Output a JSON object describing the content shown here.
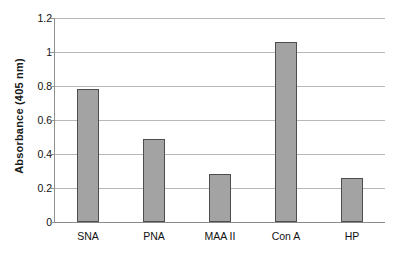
{
  "chart_data": {
    "type": "bar",
    "title": "",
    "subtitle": "",
    "xlabel": "",
    "ylabel": "Absorbance (405 nm)",
    "categories": [
      "SNA",
      "PNA",
      "MAA II",
      "Con A",
      "HP"
    ],
    "values": [
      0.78,
      0.49,
      0.285,
      1.06,
      0.26
    ],
    "series": [
      {
        "name": "Absorbance",
        "values": [
          0.78,
          0.49,
          0.285,
          1.06,
          0.26
        ]
      }
    ],
    "ylim": [
      0,
      1.2
    ],
    "ytick_values": [
      0,
      0.2,
      0.4,
      0.6,
      0.8,
      1,
      1.2
    ],
    "ytick_labels": [
      "0",
      "0.2",
      "0.4",
      "0.6",
      "0.8",
      "1",
      "1.2"
    ],
    "grid": true,
    "grid_axis": "y",
    "legend": false,
    "legend_position": "none",
    "annotations": [],
    "colors": {
      "bar_fill": "#a3a3a3",
      "bar_border": "#4d4d4d",
      "gridline": "#b8b8b8",
      "axis": "#909090",
      "text": "#111111",
      "background": "#ffffff"
    }
  }
}
